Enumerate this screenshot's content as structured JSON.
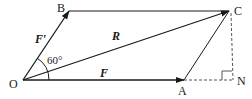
{
  "diagram": {
    "type": "parallelogram-force-addition",
    "points": {
      "O": {
        "label": "O",
        "x": 23,
        "y": 80
      },
      "A": {
        "label": "A",
        "x": 184,
        "y": 80
      },
      "B": {
        "label": "B",
        "x": 69,
        "y": 11
      },
      "C": {
        "label": "C",
        "x": 229,
        "y": 11
      },
      "N": {
        "label": "N",
        "x": 233,
        "y": 80
      }
    },
    "vectors": {
      "F": {
        "label": "F",
        "from": "O",
        "to": "A"
      },
      "F_prime": {
        "label": "F′",
        "from": "O",
        "to": "B"
      },
      "R": {
        "label": "R",
        "from": "O",
        "to": "C"
      }
    },
    "angle": {
      "label": "60°",
      "between": [
        "F",
        "F′"
      ]
    },
    "construction": {
      "dashed_lines": [
        "A-N",
        "C-N"
      ],
      "right_angle_at": "N"
    },
    "colors": {
      "line": "#1a1a1a",
      "dashed": "#555555",
      "background": "#ffffff"
    }
  }
}
